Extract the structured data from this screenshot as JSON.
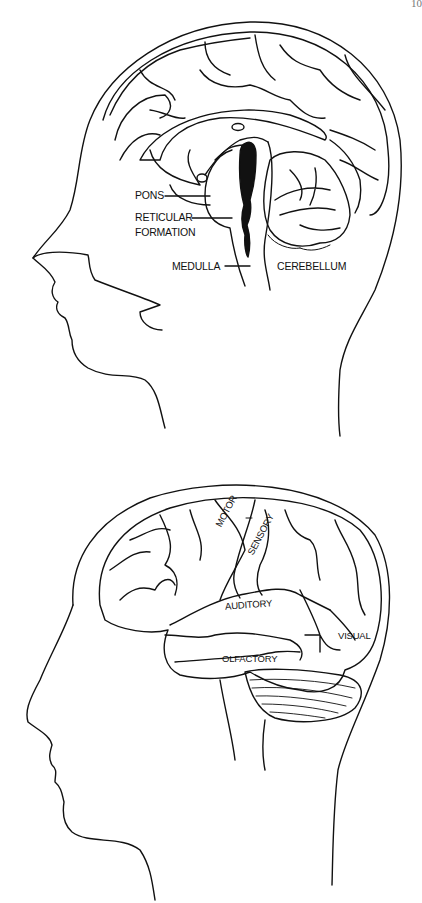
{
  "page": {
    "page_number": "10"
  },
  "figures": [
    {
      "id": "sagittal-section",
      "description": "Mid-sagittal section of the brain inside a head profile",
      "labels": {
        "pons": "PONS",
        "reticular_line1": "RETICULAR",
        "reticular_line2": "FORMATION",
        "medulla": "MEDULLA",
        "cerebellum": "CEREBELLUM"
      }
    },
    {
      "id": "lateral-view",
      "description": "Lateral view of the brain showing functional areas inside a head profile",
      "labels": {
        "motor": "MOTOR",
        "sensory": "SENSORY",
        "auditory": "AUDITORY",
        "visual": "VISUAL",
        "olfactory": "OLFACTORY"
      }
    }
  ]
}
